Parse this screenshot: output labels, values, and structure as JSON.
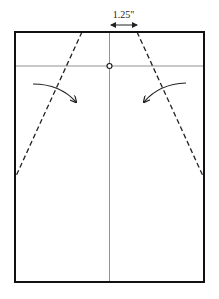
{
  "diagram": {
    "type": "folding-instruction",
    "dimension_label": "1.25\"",
    "colors": {
      "outline": "#111111",
      "guide_line": "#777777",
      "fold_line": "#222222",
      "arrow": "#222222",
      "background": "#ffffff"
    },
    "sheet": {
      "x": 15,
      "y": 32,
      "width": 189,
      "height": 250
    },
    "center_line": {
      "x": 109.5,
      "y1": 32,
      "y2": 282
    },
    "horizontal_guide": {
      "y": 66,
      "x1": 15,
      "x2": 204
    },
    "reference_point": {
      "cx": 109.5,
      "cy": 66,
      "r": 2.5
    },
    "fold_lines": [
      {
        "name": "left-fold-line",
        "x1": 82,
        "y1": 32,
        "x2": 16,
        "y2": 176
      },
      {
        "name": "right-fold-line",
        "x1": 137,
        "y1": 32,
        "x2": 203,
        "y2": 176
      }
    ],
    "fold_arrows": [
      {
        "name": "left-fold-arrow",
        "direction": "fold-inward-right"
      },
      {
        "name": "right-fold-arrow",
        "direction": "fold-inward-left"
      }
    ],
    "dimension_arrow": {
      "x1": 110,
      "x2": 137,
      "y": 24
    }
  }
}
